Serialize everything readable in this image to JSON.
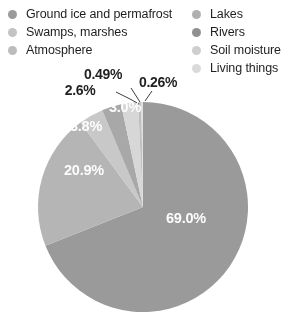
{
  "legend": {
    "left_column": [
      {
        "label": "Ground ice and permafrost",
        "color": "#9a9a9a",
        "icon": "legend-dot"
      },
      {
        "label": "Swamps, marshes",
        "color": "#c4c4c4",
        "icon": "legend-dot"
      },
      {
        "label": "Atmosphere",
        "color": "#bdbdbd",
        "icon": "legend-dot"
      }
    ],
    "right_column": [
      {
        "label": "Lakes",
        "color": "#b0b0b0",
        "icon": "legend-dot"
      },
      {
        "label": "Rivers",
        "color": "#8f8f8f",
        "icon": "legend-dot"
      },
      {
        "label": "Soil moisture",
        "color": "#cfcfcf",
        "icon": "legend-dot"
      },
      {
        "label": "Living things",
        "color": "#dcdcdc",
        "icon": "legend-dot"
      }
    ]
  },
  "chart_data": {
    "type": "pie",
    "title": "",
    "legend_position": "top",
    "labels": [
      "Ground ice and permafrost",
      "Lakes",
      "Swamps, marshes",
      "Atmosphere",
      "Soil moisture",
      "Rivers",
      "Living things"
    ],
    "values": [
      69.0,
      20.9,
      3.8,
      3.0,
      2.6,
      0.49,
      0.26
    ],
    "value_labels": [
      "69.0%",
      "20.9%",
      "3.8%",
      "3.0%",
      "2.6%",
      "0.49%",
      "0.26%"
    ],
    "colors": [
      "#9a9a9a",
      "#b5b5b5",
      "#c9c9c9",
      "#a8a8a8",
      "#d8d8d8",
      "#c0c0c0",
      "#e2e2e2"
    ],
    "units": "percent",
    "total": 100.05,
    "label_placement": {
      "inside": [
        "69.0%",
        "20.9%",
        "3.8%",
        "3.0%"
      ],
      "callout": [
        "2.6%",
        "0.49%",
        "0.26%"
      ]
    }
  },
  "slice_labels_inside": [
    {
      "text": "69.0%",
      "x": 186,
      "y": 223
    },
    {
      "text": "20.9%",
      "x": 84,
      "y": 175
    },
    {
      "text": "3.8%",
      "x": 86,
      "y": 131
    },
    {
      "text": "3.0%",
      "x": 125,
      "y": 112
    }
  ],
  "slice_labels_callout": [
    {
      "text": "0.49%",
      "x": 103,
      "y": 79
    },
    {
      "text": "2.6%",
      "x": 80,
      "y": 95
    },
    {
      "text": "0.26%",
      "x": 158,
      "y": 87
    }
  ]
}
